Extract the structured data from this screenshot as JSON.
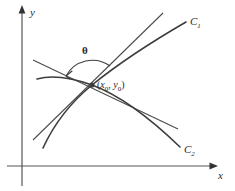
{
  "figure": {
    "kind": "geometry-diagram",
    "background_color": "#ffffff",
    "stroke_color": "#444444",
    "axis_color": "#555555",
    "text_color": "#2b2b2b"
  },
  "axes": {
    "x_label": "x",
    "y_label": "y",
    "origin_x": 22,
    "origin_y": 166
  },
  "labels": {
    "curve1": "C",
    "curve1_sub": "1",
    "curve2": "C",
    "curve2_sub": "2",
    "angle": "θ",
    "point_open": "(",
    "point_x": "x",
    "point_x_sub": "0",
    "point_comma": ", ",
    "point_y": "y",
    "point_y_sub": "0",
    "point_close": ")"
  },
  "geometry": {
    "intersection": {
      "x": 92,
      "y": 85
    },
    "curve1_path": "M 43 148 C 55 122, 70 103, 92 85 C 118 64, 148 44, 186 22",
    "curve2_path": "M 37 79 C 55 74, 75 79, 92 85 C 122 96, 152 120, 180 147",
    "tangent1_path": "M 33 140 L 163 13",
    "tangent2_path": "M 33 60 L 178 129",
    "angle_arc_path": "M 66 76 A 30 30 0 0 1 110 66",
    "angle_arrow_path": "M 66 76 L 72 71 M 66 76 L 70 79"
  }
}
